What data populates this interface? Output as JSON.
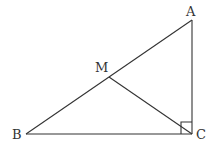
{
  "diagram": {
    "type": "geometry",
    "colors": {
      "stroke": "#333333",
      "background": "#ffffff"
    },
    "points": {
      "A": {
        "label": "A",
        "x": 192,
        "y": 20
      },
      "B": {
        "label": "B",
        "x": 26,
        "y": 134
      },
      "C": {
        "label": "C",
        "x": 192,
        "y": 134
      },
      "M": {
        "label": "M",
        "x": 109,
        "y": 77
      }
    },
    "segments": [
      "AB",
      "BC",
      "CA",
      "MC"
    ],
    "right_angle_at": "C"
  }
}
